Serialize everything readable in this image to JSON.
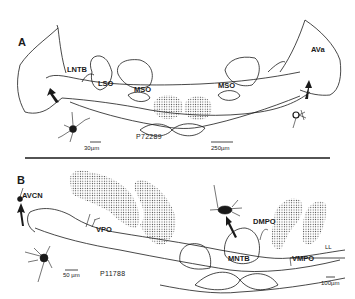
{
  "figure": {
    "panel_a": {
      "label": "A",
      "nuclei": {
        "lntb": "LNTB",
        "lso": "LSO",
        "mso_left": "MSO",
        "mso_right": "MSO",
        "ava": "AVa"
      },
      "specimen_id": "P72289",
      "scale_bars": {
        "cell": "30µm",
        "section": "250µm"
      }
    },
    "panel_b": {
      "label": "B",
      "nuclei": {
        "avcn": "AVCN",
        "vpo": "VPO",
        "dmpo": "DMPO",
        "mntb": "MNTB",
        "vmpo": "VMPO",
        "ll": "LL"
      },
      "specimen_id": "P11788",
      "scale_bars": {
        "cell": "50 µm",
        "section": "100µm"
      }
    },
    "colors": {
      "ink": "#1a1a1a",
      "background": "#ffffff"
    }
  }
}
